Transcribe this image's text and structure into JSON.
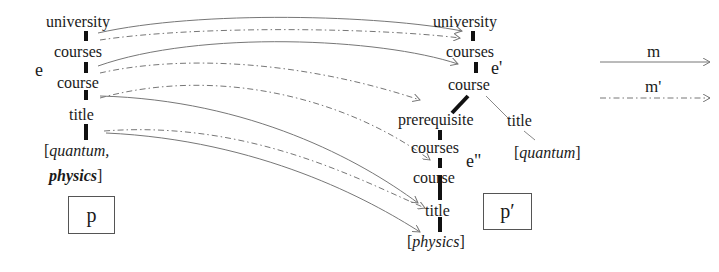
{
  "pattern_p": {
    "nodes": [
      "university",
      "courses",
      "course",
      "title"
    ],
    "value_line1": "quantum,",
    "value_line2": "physics",
    "bracket_open": "[",
    "bracket_close": "]",
    "edge_label": "e",
    "box_label": "p"
  },
  "pattern_p_prime": {
    "nodes": [
      "university",
      "courses",
      "course",
      "prerequisite",
      "title",
      "courses",
      "course",
      "title"
    ],
    "title_value": "quantum",
    "physics_value": "physics",
    "bracket_open": "[",
    "bracket_close": "]",
    "edge_labels": [
      "e'",
      "e\""
    ],
    "box_label": "p′"
  },
  "legend": {
    "solid_label": "m",
    "dashed_label": "m'"
  }
}
